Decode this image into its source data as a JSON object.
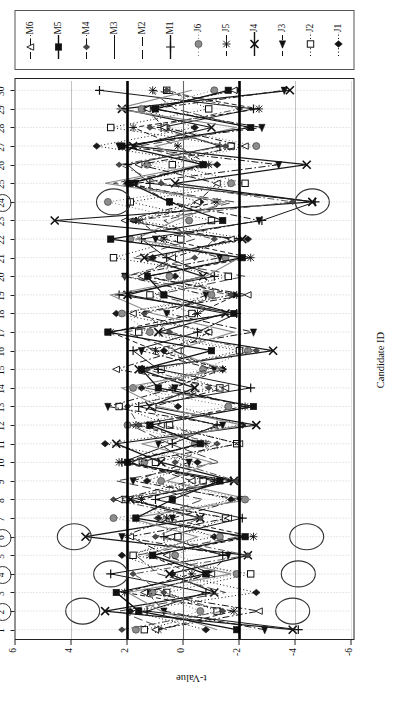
{
  "chart_data": {
    "type": "scatter",
    "title": "",
    "xlabel": "Candidate ID",
    "ylabel": "t-Value",
    "orientation": "rotated-90",
    "xlim": [
      0.5,
      30.5
    ],
    "ylim": [
      -6,
      6
    ],
    "y_ticks": [
      6,
      4,
      2,
      0,
      -2,
      -4,
      -6
    ],
    "x_ticks": [
      1,
      2,
      3,
      4,
      5,
      6,
      7,
      8,
      9,
      10,
      11,
      12,
      13,
      14,
      15,
      16,
      17,
      18,
      19,
      20,
      21,
      22,
      23,
      24,
      25,
      26,
      27,
      28,
      29,
      30
    ],
    "grid": "dotted-vertical",
    "legend_position": "right",
    "control_limits": [
      2,
      -2
    ],
    "center_line": 0,
    "highlighted_candidates": [
      2,
      4,
      6,
      24
    ],
    "categories": [
      1,
      2,
      3,
      4,
      5,
      6,
      7,
      8,
      9,
      10,
      11,
      12,
      13,
      14,
      15,
      16,
      17,
      18,
      19,
      20,
      21,
      22,
      23,
      24,
      25,
      26,
      27,
      28,
      29,
      30
    ],
    "series": [
      {
        "name": "J1",
        "marker": "diamond-filled",
        "line": "dotted",
        "color": "#1a1a1a",
        "values": [
          -0.8,
          1.9,
          -2.6,
          0.4,
          2.2,
          -1.1,
          0.9,
          -1.7,
          1.3,
          -0.5,
          2.8,
          -2.1,
          0.2,
          1.5,
          -1.4,
          0.7,
          -0.9,
          2.4,
          -1.8,
          0.3,
          1.1,
          -2.3,
          1.7,
          -0.6,
          2.0,
          -1.2,
          3.1,
          -0.4,
          1.4,
          -1.9
        ]
      },
      {
        "name": "J2",
        "marker": "square-open",
        "line": "dotted",
        "color": "#1a1a1a",
        "values": [
          1.4,
          -1.2,
          0.6,
          -2.4,
          1.8,
          0.2,
          -1.5,
          2.1,
          -0.7,
          1.0,
          -1.9,
          0.5,
          2.3,
          -1.3,
          0.8,
          -2.0,
          1.6,
          -0.3,
          1.2,
          -1.6,
          2.5,
          0.1,
          -1.0,
          1.9,
          -2.2,
          0.4,
          -1.7,
          2.6,
          -0.9,
          0.6
        ]
      },
      {
        "name": "J3",
        "marker": "triangle-left-filled",
        "line": "dash-dot",
        "color": "#1a1a1a",
        "values": [
          -2.9,
          0.7,
          1.3,
          -0.9,
          -1.6,
          2.2,
          0.4,
          -2.0,
          1.8,
          -0.2,
          0.9,
          -1.4,
          2.7,
          0.3,
          -1.1,
          1.5,
          -2.5,
          0.6,
          -0.8,
          2.1,
          -1.3,
          1.0,
          -2.7,
          0.5,
          1.7,
          -3.4,
          2.3,
          -2.8,
          1.1,
          -3.6
        ]
      },
      {
        "name": "J4",
        "marker": "x-thick",
        "line": "solid",
        "color": "#1a1a1a",
        "values": [
          -3.9,
          2.8,
          -1.1,
          0.5,
          -2.3,
          3.5,
          -0.6,
          1.9,
          -1.8,
          0.8,
          2.4,
          -2.6,
          1.2,
          -0.4,
          1.6,
          -3.2,
          0.9,
          -1.5,
          2.0,
          -0.7,
          1.4,
          -2.1,
          4.6,
          -4.6,
          0.3,
          -4.4,
          1.8,
          -1.0,
          2.2,
          -3.8
        ]
      },
      {
        "name": "J5",
        "marker": "asterisk",
        "line": "dashed",
        "color": "#1a1a1a",
        "values": [
          0.9,
          -1.8,
          2.1,
          -0.3,
          1.2,
          -2.5,
          0.6,
          1.5,
          -1.1,
          2.3,
          -0.8,
          1.7,
          -2.2,
          0.4,
          -1.4,
          1.0,
          2.6,
          -0.5,
          -1.9,
          1.3,
          -2.4,
          0.7,
          1.6,
          -1.2,
          2.0,
          -0.9,
          0.2,
          1.8,
          -2.7,
          1.1
        ]
      },
      {
        "name": "J6",
        "marker": "circle-gray",
        "line": "dotted",
        "color": "#777777",
        "values": [
          1.7,
          -0.6,
          1.1,
          -1.9,
          0.3,
          -1.3,
          2.5,
          -2.2,
          0.8,
          1.4,
          -0.4,
          2.0,
          -1.6,
          1.8,
          -0.7,
          -2.3,
          1.2,
          2.2,
          -1.0,
          0.5,
          -1.5,
          1.9,
          -0.2,
          2.7,
          -1.7,
          1.3,
          -2.6,
          0.6,
          1.5,
          -1.1
        ]
      },
      {
        "name": "M1",
        "marker": "plus",
        "line": "solid-thin",
        "color": "#1a1a1a",
        "values": [
          -4.1,
          1.3,
          -0.8,
          2.6,
          -1.4,
          0.7,
          -2.1,
          1.0,
          -1.7,
          2.2,
          0.4,
          -1.2,
          1.6,
          -2.4,
          0.9,
          1.8,
          -0.5,
          -1.9,
          2.3,
          -1.1,
          0.6,
          1.5,
          -2.8,
          -4.7,
          1.2,
          2.0,
          -1.3,
          0.8,
          -2.5,
          3.0
        ]
      },
      {
        "name": "M2",
        "marker": "none",
        "line": "dashed-long",
        "color": "#444444",
        "values": [
          0.6,
          2.3,
          -1.5,
          0.9,
          1.7,
          -2.0,
          1.1,
          -0.7,
          2.4,
          -1.3,
          0.5,
          1.9,
          -2.6,
          1.4,
          -0.9,
          0.2,
          2.1,
          -1.6,
          1.0,
          -2.2,
          1.8,
          -0.4,
          0.7,
          -1.8,
          2.5,
          -1.0,
          1.6,
          -2.3,
          0.3,
          1.2
        ]
      },
      {
        "name": "M3",
        "marker": "none",
        "line": "solid-gray",
        "color": "#8a8a8a",
        "values": [
          -1.2,
          0.8,
          2.0,
          -1.7,
          1.3,
          -0.5,
          1.9,
          -2.4,
          0.6,
          -1.0,
          1.5,
          -2.1,
          0.9,
          2.2,
          -1.4,
          0.4,
          -1.8,
          1.1,
          2.6,
          -0.8,
          -2.0,
          1.7,
          0.3,
          -1.5,
          2.8,
          -0.6,
          1.0,
          -1.9,
          2.4,
          -0.3
        ]
      },
      {
        "name": "M4",
        "marker": "diamond-small",
        "line": "dash-dot",
        "color": "#555555",
        "values": [
          2.2,
          -1.4,
          0.7,
          1.8,
          -2.3,
          1.0,
          -0.6,
          2.5,
          -1.9,
          0.3,
          -1.2,
          1.6,
          2.0,
          -0.9,
          1.3,
          -2.6,
          0.5,
          1.4,
          -1.7,
          2.1,
          -0.4,
          -1.1,
          1.8,
          -3.9,
          0.8,
          2.3,
          -1.5,
          1.2,
          -2.0,
          0.6
        ]
      },
      {
        "name": "M5",
        "marker": "square-filled",
        "line": "solid",
        "color": "#111111",
        "values": [
          -1.9,
          1.6,
          2.4,
          -0.8,
          1.1,
          -2.2,
          1.7,
          0.4,
          -1.3,
          2.0,
          -0.6,
          1.2,
          -2.5,
          0.9,
          1.5,
          -1.0,
          2.7,
          -1.8,
          0.7,
          1.3,
          -2.1,
          2.6,
          -1.4,
          0.5,
          1.9,
          -0.7,
          2.2,
          -2.4,
          1.0,
          -1.6
        ]
      },
      {
        "name": "M6",
        "marker": "triangle-open",
        "line": "dash-dot",
        "color": "#1a1a1a",
        "values": [
          1.0,
          -2.7,
          1.4,
          -1.0,
          0.6,
          1.9,
          -1.6,
          2.3,
          -0.3,
          1.7,
          -2.0,
          0.8,
          1.1,
          -1.5,
          2.4,
          0.2,
          -0.9,
          1.8,
          -2.3,
          1.5,
          0.4,
          -1.7,
          2.1,
          -0.5,
          -1.2,
          1.6,
          -2.2,
          0.7,
          1.3,
          -1.8
        ]
      }
    ],
    "annotations": [
      {
        "label": "outlier-candidate-2",
        "candidate": 2,
        "t": 3.6
      },
      {
        "label": "outlier-candidate-4",
        "candidate": 4,
        "t": 2.6
      },
      {
        "label": "outlier-candidate-6",
        "candidate": 6,
        "t": 3.9
      },
      {
        "label": "outlier-candidate-24-low",
        "candidate": 24,
        "t": -4.6
      },
      {
        "label": "outlier-candidate-24-high",
        "candidate": 24,
        "t": 2.5
      },
      {
        "label": "outlier-candidate-2-neg",
        "candidate": 2,
        "t": -3.9
      },
      {
        "label": "outlier-candidate-4-neg",
        "candidate": 4,
        "t": -4.1
      },
      {
        "label": "outlier-candidate-6-neg",
        "candidate": 6,
        "t": -4.4
      }
    ]
  },
  "axes": {
    "x_title": "Candidate ID",
    "y_title": "t-Value",
    "y_tick_labels": [
      "6",
      "4",
      "2",
      "0",
      "-2",
      "-4",
      "-6"
    ],
    "x_tick_labels": [
      "1",
      "2",
      "3",
      "4",
      "5",
      "6",
      "7",
      "8",
      "9",
      "10",
      "11",
      "12",
      "13",
      "14",
      "15",
      "16",
      "17",
      "18",
      "19",
      "20",
      "21",
      "22",
      "23",
      "24",
      "25",
      "26",
      "27",
      "28",
      "29",
      "30"
    ],
    "circled_ids": [
      "2",
      "4",
      "6",
      "24"
    ]
  },
  "legend": {
    "items": [
      {
        "label": "J1",
        "marker": "diamond-filled",
        "line": "dotted"
      },
      {
        "label": "J2",
        "marker": "square-open",
        "line": "dotted"
      },
      {
        "label": "J3",
        "marker": "triangle-left-filled",
        "line": "dashed"
      },
      {
        "label": "J4",
        "marker": "x-thick",
        "line": "solid"
      },
      {
        "label": "J5",
        "marker": "asterisk",
        "line": "dashed"
      },
      {
        "label": "J6",
        "marker": "circle-gray",
        "line": "dotted"
      },
      {
        "label": "M1",
        "marker": "plus",
        "line": "solid"
      },
      {
        "label": "M2",
        "marker": "none",
        "line": "dashed-long"
      },
      {
        "label": "M3",
        "marker": "none",
        "line": "solid-gray"
      },
      {
        "label": "M4",
        "marker": "diamond-small",
        "line": "dash-dot"
      },
      {
        "label": "M5",
        "marker": "square-filled",
        "line": "solid"
      },
      {
        "label": "M6",
        "marker": "triangle-open",
        "line": "dash-dot"
      }
    ]
  }
}
